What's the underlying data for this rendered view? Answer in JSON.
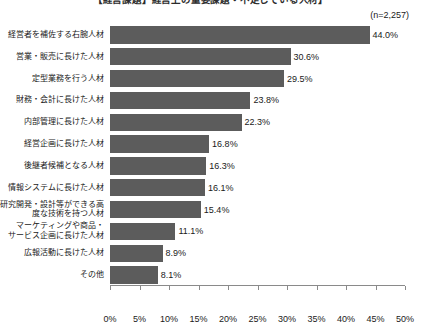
{
  "title": "【経営課題】経営上の重要課題・不足している人材】",
  "sample_size": "(n=2,257)",
  "colors": {
    "bar": "#5c5c5c",
    "axis": "#8a8a8a",
    "text": "#1a1a1a"
  },
  "chart_data": {
    "type": "bar",
    "orientation": "horizontal",
    "title": "【経営課題】経営上の重要課題・不足している人材】",
    "annotation": "(n=2,257)",
    "xlabel": "",
    "ylabel": "",
    "xlim": [
      0,
      50
    ],
    "xunit": "%",
    "grid": false,
    "legend": false,
    "tick_labels": [
      "0%",
      "5%",
      "10%",
      "15%",
      "20%",
      "25%",
      "30%",
      "35%",
      "40%",
      "45%",
      "50%"
    ],
    "tick_values": [
      0,
      5,
      10,
      15,
      20,
      25,
      30,
      35,
      40,
      45,
      50
    ],
    "categories": [
      "経営者を補佐する右腕人材",
      "営業・販売に長けた人材",
      "定型業務を行う人材",
      "財務・会計に長けた人材",
      "内部管理に長けた人材",
      "経営企画に長けた人材",
      "後継者候補となる人材",
      "情報システムに長けた人材",
      "研究開発・設計等ができる高\n度な技術を持つ人材",
      "マーケティングや商品・\nサービス企画に長けた人材",
      "広報活動に長けた人材",
      "その他"
    ],
    "values": [
      44.0,
      30.6,
      29.5,
      23.8,
      22.3,
      16.8,
      16.3,
      16.1,
      15.4,
      11.1,
      8.9,
      8.1
    ],
    "value_labels": [
      "44.0%",
      "30.6%",
      "29.5%",
      "23.8%",
      "22.3%",
      "16.8%",
      "16.3%",
      "16.1%",
      "15.4%",
      "11.1%",
      "8.9%",
      "8.1%"
    ]
  }
}
